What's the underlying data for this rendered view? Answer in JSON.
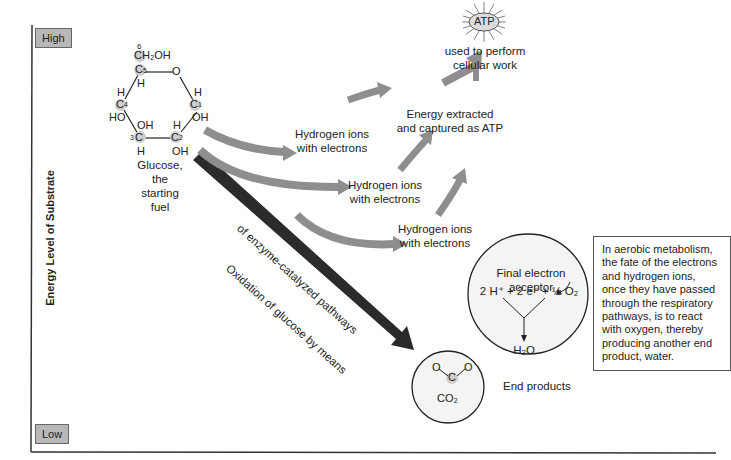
{
  "axis": {
    "title": "Energy Level of Substrate",
    "high_label": "High",
    "low_label": "Low"
  },
  "glucose": {
    "caption_line1": "Glucose,",
    "caption_line2": "the",
    "caption_line3": "starting",
    "caption_line4": "fuel",
    "atoms": {
      "c6_num": "6",
      "ch2oh": "CH₂OH",
      "c5": "C",
      "c5_num": "5",
      "c5_h": "H",
      "ring_o": "O",
      "c4": "C",
      "c4_num": "4",
      "c4_h": "H",
      "c4_ho": "HO",
      "c1": "C",
      "c1_num": "1",
      "c1_h": "H",
      "c1_oh": "OH",
      "c3": "C",
      "c3_num": "3",
      "c3_oh": "OH",
      "c3_h": "H",
      "c2": "C",
      "c2_num": "2",
      "c2_h": "H",
      "c2_oh": "OH"
    }
  },
  "flow": {
    "hydrogen_1_line1": "Hydrogen ions",
    "hydrogen_1_line2": "with electrons",
    "hydrogen_2_line1": "Hydrogen ions",
    "hydrogen_2_line2": "with electrons",
    "hydrogen_3_line1": "Hydrogen ions",
    "hydrogen_3_line2": "with electrons",
    "energy_line1": "Energy extracted",
    "energy_line2": "and captured as ATP",
    "atp": "ATP",
    "atp_use_line1": "used to perform",
    "atp_use_line2": "cellular work",
    "oxidation_line1": "Oxidation of glucose by means",
    "oxidation_line2": "of enzyme-catalyzed pathways"
  },
  "acceptor_circle": {
    "title": "Final electron acceptor",
    "equation": "2 H⁺ + 2 e⁻ + ½ O₂",
    "product": "H₂O"
  },
  "co2_circle": {
    "o_left": "O",
    "o_right": "O",
    "c": "C",
    "label": "CO₂"
  },
  "end_products_label": "End products",
  "note": "In aerobic metabolism, the fate of the electrons and hydrogen ions, once they have passed through the respiratory pathways, is to react with oxygen, thereby producing another end product, water.",
  "colors": {
    "arrow_gray": "#9a9a9a",
    "arrow_dark": "#2b2b2b",
    "box_gray": "#b8b8b8",
    "atom_highlight": "#cfcfcf"
  }
}
